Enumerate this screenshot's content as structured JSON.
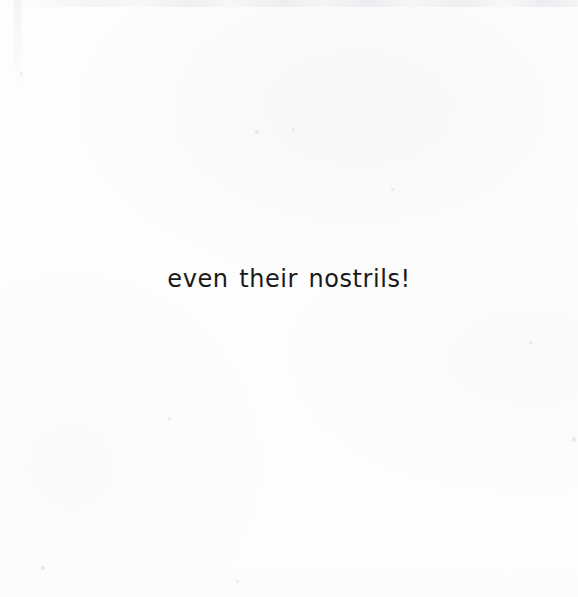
{
  "page": {
    "width": 578,
    "height": 597,
    "background_color": "#fdfdfd",
    "medium": "scanned-book-page"
  },
  "content": {
    "body_text": "even their nostrils!",
    "text_color": "#1a1a1a",
    "alignment": "center",
    "line_count": 1
  },
  "artifacts": {
    "top_edge_band": "scanner-edge-shadow",
    "left_edge_streak": "scanner-edge-streak",
    "bottom_edge_wash": "paper-tone-gradient",
    "specks": [
      {
        "x": 255,
        "y": 130,
        "size": 4
      },
      {
        "x": 292,
        "y": 128,
        "size": 3
      },
      {
        "x": 391,
        "y": 188,
        "size": 3
      },
      {
        "x": 529,
        "y": 341,
        "size": 3
      },
      {
        "x": 41,
        "y": 566,
        "size": 4
      },
      {
        "x": 168,
        "y": 417,
        "size": 3
      },
      {
        "x": 574,
        "y": 437,
        "size": 4
      },
      {
        "x": 20,
        "y": 72,
        "size": 3
      },
      {
        "x": 236,
        "y": 580,
        "size": 3
      }
    ]
  }
}
